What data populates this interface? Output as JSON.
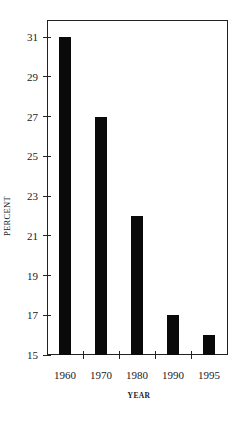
{
  "chart_data": {
    "type": "bar",
    "title": "",
    "xlabel": "YEAR",
    "ylabel": "PERCENT",
    "categories": [
      "1960",
      "1970",
      "1980",
      "1990",
      "1995"
    ],
    "values": [
      31,
      27,
      22,
      17,
      16
    ],
    "ylim": [
      15,
      31
    ],
    "yticks": [
      15,
      17,
      19,
      21,
      23,
      25,
      27,
      29,
      31
    ],
    "grid": false,
    "legend": null,
    "bar_color": "#0a0a0a"
  },
  "axis": {
    "x_title": "YEAR",
    "y_title": "PERCENT"
  }
}
